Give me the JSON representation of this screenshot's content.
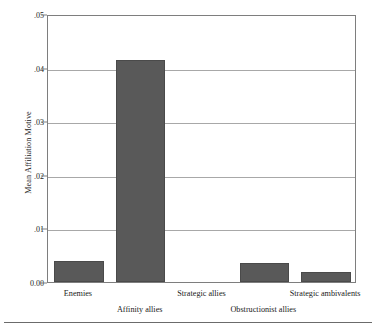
{
  "chart_data": {
    "type": "bar",
    "title": "",
    "xlabel": "",
    "ylabel": "Mean Affiliation Motive",
    "categories": [
      "Enemies",
      "Affinity allies",
      "Strategic allies",
      "Obstructionist allies",
      "Strategic ambivalents"
    ],
    "values": [
      0.0039,
      0.0415,
      0.0,
      0.0036,
      0.0019
    ],
    "ylim": [
      0.0,
      0.05
    ],
    "yticks": [
      0.0,
      0.01,
      0.02,
      0.03,
      0.04,
      0.05
    ],
    "ytick_labels": [
      "0.00",
      ".01",
      ".02",
      ".03",
      ".04",
      ".05"
    ],
    "grid": "horizontal",
    "legend": "none",
    "bar_color": "#595959",
    "label_rows": [
      "top",
      "bottom",
      "top",
      "bottom",
      "top"
    ]
  },
  "axes": {
    "y_title": "Mean Affiliation Motive",
    "frame_color": "#7e7e7e",
    "gridline_color": "#a8a8a8"
  }
}
